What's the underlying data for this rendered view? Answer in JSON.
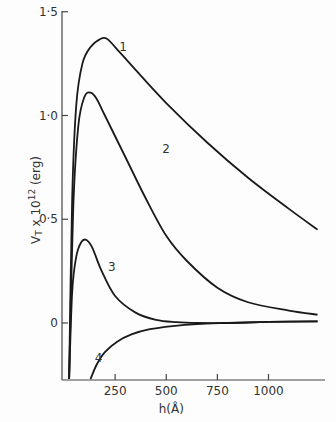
{
  "chart_data": {
    "type": "line",
    "title": "",
    "xlabel": "h(Å)",
    "ylabel": "V_T x 10^12 (erg)",
    "ylabel_parts": {
      "main": "V",
      "sub": "T",
      "mid": " x 10",
      "sup": "12",
      "end": " (erg)"
    },
    "xlim": [
      0,
      1270
    ],
    "ylim": [
      -0.27,
      1.5
    ],
    "x_ticks": [
      250,
      500,
      750,
      1000
    ],
    "x_tick_labels": [
      "250",
      "500",
      "750",
      "1000"
    ],
    "y_ticks": [
      0,
      0.5,
      1.0,
      1.5
    ],
    "y_tick_labels": [
      "0",
      "0·5",
      "1·0",
      "1·5"
    ],
    "grid": false,
    "legend": "inline curve labels",
    "series": [
      {
        "name": "1",
        "label_at": [
          270,
          1.31
        ],
        "x": [
          25,
          40,
          60,
          90,
          130,
          180,
          210,
          250,
          350,
          500,
          700,
          900,
          1100,
          1240
        ],
        "y": [
          -0.27,
          0.6,
          1.05,
          1.25,
          1.33,
          1.37,
          1.37,
          1.33,
          1.22,
          1.06,
          0.87,
          0.7,
          0.55,
          0.45
        ]
      },
      {
        "name": "2",
        "label_at": [
          480,
          0.82
        ],
        "x": [
          25,
          45,
          70,
          100,
          130,
          160,
          200,
          300,
          400,
          500,
          600,
          750,
          900,
          1100,
          1240
        ],
        "y": [
          -0.27,
          0.55,
          0.95,
          1.09,
          1.11,
          1.08,
          1.0,
          0.8,
          0.6,
          0.42,
          0.3,
          0.17,
          0.1,
          0.06,
          0.04
        ]
      },
      {
        "name": "3",
        "label_at": [
          215,
          0.25
        ],
        "x": [
          25,
          40,
          60,
          85,
          110,
          140,
          180,
          250,
          350,
          450,
          550,
          650,
          800,
          1000,
          1240
        ],
        "y": [
          -0.27,
          0.15,
          0.32,
          0.39,
          0.4,
          0.36,
          0.26,
          0.13,
          0.05,
          0.015,
          0.004,
          0.0,
          0.0,
          0.005,
          0.008
        ]
      },
      {
        "name": "4",
        "label_at": [
          150,
          -0.19
        ],
        "x": [
          130,
          160,
          200,
          260,
          330,
          420,
          530,
          650,
          800,
          1000,
          1240
        ],
        "y": [
          -0.27,
          -0.2,
          -0.14,
          -0.09,
          -0.055,
          -0.03,
          -0.015,
          -0.005,
          0.0,
          0.005,
          0.008
        ]
      }
    ]
  }
}
